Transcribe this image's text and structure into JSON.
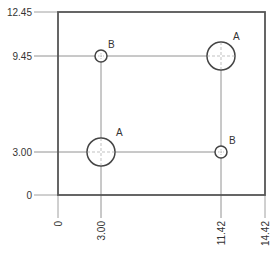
{
  "drawing": {
    "type": "ordinate-dimension hole layout",
    "colors": {
      "outline": "#555555",
      "leader": "#777777",
      "hole": "#444444",
      "text": "#333333"
    },
    "y_dimensions": [
      {
        "id": "y0",
        "label": "0"
      },
      {
        "id": "y1",
        "label": "3.00"
      },
      {
        "id": "y2",
        "label": "9.45"
      },
      {
        "id": "y3",
        "label": "12.45"
      }
    ],
    "x_dimensions": [
      {
        "id": "x0",
        "label": "0"
      },
      {
        "id": "x1",
        "label": "3.00"
      },
      {
        "id": "x2",
        "label": "11.42"
      },
      {
        "id": "x3",
        "label": "14.42"
      }
    ],
    "holes": [
      {
        "id": "hole-1",
        "tag": "B",
        "x": 3.0,
        "y": 9.45,
        "size": "small"
      },
      {
        "id": "hole-2",
        "tag": "A",
        "x": 11.42,
        "y": 9.45,
        "size": "large"
      },
      {
        "id": "hole-3",
        "tag": "A",
        "x": 3.0,
        "y": 3.0,
        "size": "large"
      },
      {
        "id": "hole-4",
        "tag": "B",
        "x": 11.42,
        "y": 3.0,
        "size": "small"
      }
    ]
  }
}
